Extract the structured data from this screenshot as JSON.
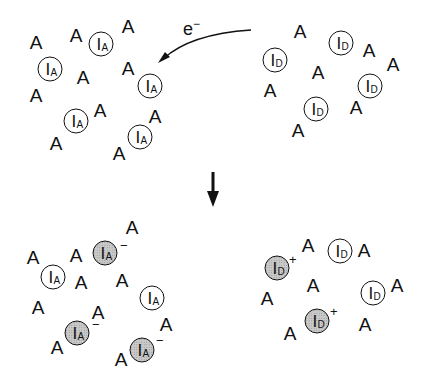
{
  "diagram": {
    "electron_label": "e",
    "electron_sign": "−",
    "acceptor_symbol": "A",
    "intercalant_symbol": "I",
    "acceptor_sub": "A",
    "donor_sub": "D",
    "minus": "−",
    "plus": "+",
    "colors": {
      "ink": "#111111",
      "shaded_fill": "#c9c9c9",
      "background": "#ffffff"
    }
  }
}
